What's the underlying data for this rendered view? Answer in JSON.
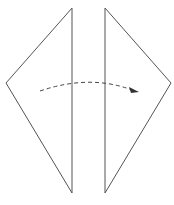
{
  "diagram": {
    "type": "origami-fold-step",
    "stroke_color": "#555555",
    "left_flap": {
      "points": [
        [
          72,
          8
        ],
        [
          6,
          83
        ],
        [
          72,
          193
        ]
      ]
    },
    "right_flap": {
      "points": [
        [
          105,
          8
        ],
        [
          171,
          83
        ],
        [
          105,
          193
        ]
      ]
    },
    "fold_arrow": {
      "style": "dashed",
      "direction": "left-to-right",
      "start": [
        40,
        91
      ],
      "control": [
        90,
        75
      ],
      "end": [
        138,
        92
      ]
    }
  }
}
